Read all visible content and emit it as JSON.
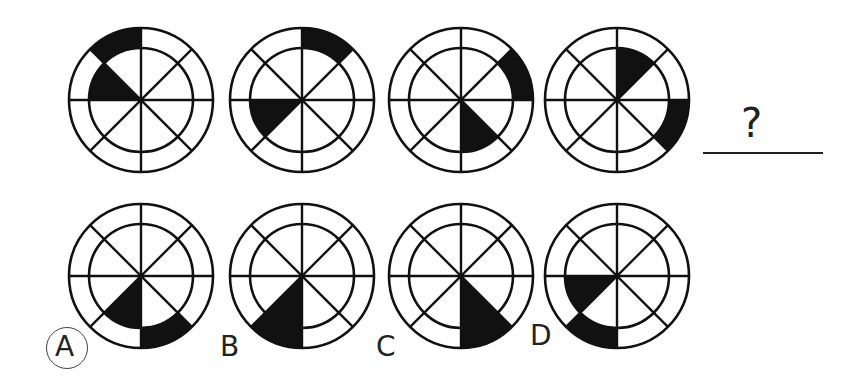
{
  "puzzle": {
    "question_mark": "?",
    "ink_color": "#111111",
    "sequence": [
      {
        "id": "seq-1",
        "cx": 141,
        "cy": 100,
        "inner_shaded": [
          [
            135,
            180
          ]
        ],
        "outer_shaded": [
          [
            90,
            135
          ]
        ]
      },
      {
        "id": "seq-2",
        "cx": 302,
        "cy": 100,
        "inner_shaded": [
          [
            180,
            225
          ]
        ],
        "outer_shaded": [
          [
            45,
            90
          ]
        ]
      },
      {
        "id": "seq-3",
        "cx": 461,
        "cy": 100,
        "inner_shaded": [
          [
            270,
            315
          ]
        ],
        "outer_shaded": [
          [
            0,
            45
          ]
        ]
      },
      {
        "id": "seq-4",
        "cx": 617,
        "cy": 100,
        "inner_shaded": [
          [
            45,
            90
          ]
        ],
        "outer_shaded": [
          [
            315,
            360
          ]
        ]
      }
    ],
    "options": [
      {
        "label": "A",
        "selected": true,
        "cx": 141,
        "cy": 276,
        "inner_shaded": [
          [
            225,
            270
          ]
        ],
        "outer_shaded": [
          [
            270,
            315
          ]
        ]
      },
      {
        "label": "B",
        "selected": false,
        "cx": 302,
        "cy": 276,
        "inner_shaded": [
          [
            225,
            270
          ]
        ],
        "outer_shaded": [
          [
            225,
            270
          ]
        ]
      },
      {
        "label": "C",
        "selected": false,
        "cx": 461,
        "cy": 276,
        "inner_shaded": [
          [
            270,
            315
          ]
        ],
        "outer_shaded": [
          [
            270,
            315
          ]
        ]
      },
      {
        "label": "D",
        "selected": false,
        "cx": 617,
        "cy": 276,
        "inner_shaded": [
          [
            180,
            225
          ]
        ],
        "outer_shaded": [
          [
            225,
            270
          ]
        ]
      }
    ],
    "radii": {
      "outer": 72,
      "inner": 52
    }
  }
}
